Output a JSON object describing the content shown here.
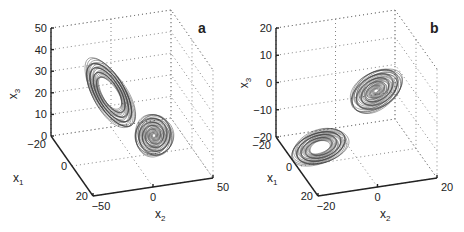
{
  "chart_data": [
    {
      "type": "line",
      "panel": "a",
      "title": "",
      "projection": "3d",
      "axes": {
        "x1": {
          "label": "x",
          "subscript": "1",
          "range": [
            -20,
            20
          ],
          "ticks": [
            -20,
            0,
            20
          ],
          "tick_labels": [
            "−20",
            "0",
            "20"
          ]
        },
        "x2": {
          "label": "x",
          "subscript": "2",
          "range": [
            -50,
            50
          ],
          "ticks": [
            -50,
            0,
            50
          ],
          "tick_labels": [
            "−50",
            "0",
            "50"
          ]
        },
        "x3": {
          "label": "x",
          "subscript": "3",
          "range": [
            0,
            50
          ],
          "ticks": [
            0,
            10,
            20,
            30,
            40,
            50
          ],
          "tick_labels": [
            "0",
            "10",
            "20",
            "30",
            "40",
            "50"
          ]
        }
      },
      "grid": true,
      "series": [
        {
          "name": "trajectory",
          "shape": "two-lobed butterfly attractor",
          "lobes": [
            {
              "center": {
                "x1": -5,
                "x2": -15,
                "x3": 27
              },
              "extent_x3": [
                5,
                45
              ],
              "note": "large tilted lobe, open center"
            },
            {
              "center": {
                "x1": 5,
                "x2": 12,
                "x3": 13
              },
              "extent_x3": [
                2,
                24
              ],
              "note": "smaller dense lobe, tight spiral core"
            }
          ]
        }
      ]
    },
    {
      "type": "line",
      "panel": "b",
      "title": "",
      "projection": "3d",
      "axes": {
        "x1": {
          "label": "x",
          "subscript": "1",
          "range": [
            -20,
            20
          ],
          "ticks": [
            -20,
            0,
            20
          ],
          "tick_labels": [
            "−20",
            "0",
            "20"
          ]
        },
        "x2": {
          "label": "x",
          "subscript": "2",
          "range": [
            -20,
            20
          ],
          "ticks": [
            -20,
            0,
            20
          ],
          "tick_labels": [
            "−20",
            "0",
            "20"
          ]
        },
        "x3": {
          "label": "x",
          "subscript": "3",
          "range": [
            -20,
            20
          ],
          "ticks": [
            -20,
            -10,
            0,
            10,
            20
          ],
          "tick_labels": [
            "−20",
            "−10",
            "0",
            "10",
            "20"
          ]
        }
      },
      "grid": true,
      "series": [
        {
          "name": "trajectory",
          "shape": "figure-eight double-scroll attractor",
          "lobes": [
            {
              "center": {
                "x1": 2,
                "x2": -12,
                "x3": -13
              },
              "note": "left lobe, open center"
            },
            {
              "center": {
                "x1": -4,
                "x2": 8,
                "x3": 0
              },
              "note": "right lobe, dense core"
            }
          ]
        }
      ]
    }
  ],
  "panels": {
    "a": {
      "label": "a"
    },
    "b": {
      "label": "b"
    }
  }
}
